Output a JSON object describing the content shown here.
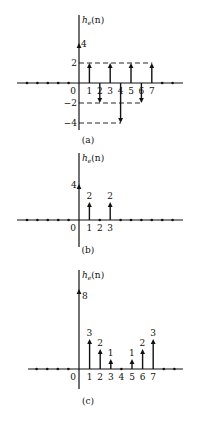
{
  "chart_data": [
    {
      "type": "stem",
      "panel": "(a)",
      "ylabel": "h_e(n)",
      "caption": "(a)",
      "x": [
        0,
        1,
        2,
        3,
        4,
        5,
        6,
        7
      ],
      "values": [
        4,
        2,
        -2,
        2,
        -4,
        2,
        -2,
        2
      ],
      "x_tick_labels": [
        "0",
        "1",
        "2",
        "3",
        "4",
        "5",
        "6",
        "7"
      ],
      "y_tick_labels": [
        "4",
        "2",
        "-2",
        "-4"
      ],
      "y_ticks": [
        4,
        2,
        -2,
        -4
      ],
      "dashed_reference_lines": [
        2,
        -2,
        -4
      ],
      "grid": false
    },
    {
      "type": "stem",
      "panel": "(b)",
      "ylabel": "h_e(n)",
      "caption": "(b)",
      "x": [
        0,
        1,
        2,
        3
      ],
      "values": [
        4,
        2,
        0,
        2
      ],
      "x_tick_labels": [
        "0",
        "1",
        "2",
        "3"
      ],
      "y_tick_labels": [
        "4"
      ],
      "value_labels": [
        "",
        "2",
        "",
        "2"
      ],
      "grid": false
    },
    {
      "type": "stem",
      "panel": "(c)",
      "ylabel": "h_e(n)",
      "caption": "(c)",
      "x": [
        0,
        1,
        2,
        3,
        4,
        5,
        6,
        7
      ],
      "values": [
        8,
        3,
        2,
        1,
        0,
        1,
        2,
        3
      ],
      "x_tick_labels": [
        "0",
        "1",
        "2",
        "3",
        "4",
        "5",
        "6",
        "7"
      ],
      "value_labels": [
        "8",
        "3",
        "2",
        "1",
        "",
        "1",
        "2",
        "3"
      ],
      "grid": false
    }
  ]
}
